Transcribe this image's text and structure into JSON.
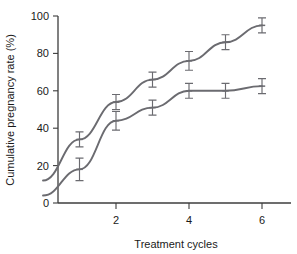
{
  "chart_data": {
    "type": "line",
    "title": "",
    "xlabel": "Treatment cycles",
    "ylabel": "Cumulative pregnancy rate (%)",
    "xlim": [
      0,
      6.8
    ],
    "ylim": [
      0,
      100
    ],
    "grid": false,
    "legend": "none",
    "xticks": [
      2,
      4,
      6
    ],
    "yticks": [
      0,
      20,
      40,
      60,
      80,
      100
    ],
    "x": [
      0,
      1,
      2,
      3,
      4,
      5,
      6
    ],
    "series": [
      {
        "name": "upper-series",
        "color": "#6b6b70",
        "values": [
          12,
          34,
          54,
          66,
          76,
          86,
          95
        ],
        "err_low": [
          null,
          4,
          4,
          4,
          5,
          4,
          4
        ],
        "err_high": [
          null,
          4,
          4,
          4,
          5,
          4,
          4
        ],
        "marker_cycles": [
          1,
          2,
          3,
          4,
          5,
          6
        ]
      },
      {
        "name": "lower-series",
        "color": "#6b6b70",
        "values": [
          4,
          18,
          44,
          51,
          60,
          60,
          62.5
        ],
        "err_low": [
          null,
          6,
          5,
          4,
          4,
          4,
          4
        ],
        "err_high": [
          null,
          6,
          5,
          4,
          4,
          4,
          4
        ],
        "marker_cycles": [
          1,
          2,
          3,
          4,
          5,
          6
        ]
      }
    ]
  },
  "axes": {
    "ytick_labels": [
      "0",
      "20",
      "40",
      "60",
      "80",
      "100"
    ],
    "xtick_labels": [
      "2",
      "4",
      "6"
    ],
    "xlabel_text": "Treatment cycles",
    "ylabel_text": "Cumulative pregnancy rate (%)"
  },
  "colors": {
    "axis": "#3c3c3c",
    "series": "#6b6b70",
    "background": "#ffffff",
    "text": "#1a1a1a"
  }
}
